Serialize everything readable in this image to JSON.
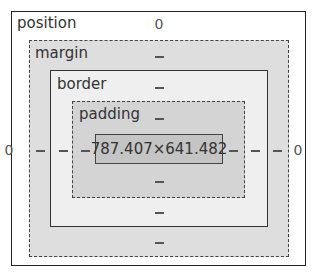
{
  "box_model": {
    "position": {
      "label": "position",
      "top": "0",
      "right": "0",
      "bottom": "",
      "left": "0"
    },
    "margin": {
      "label": "margin",
      "top": "–",
      "right": "–",
      "bottom": "–",
      "left": "–"
    },
    "border": {
      "label": "border",
      "top": "–",
      "right": "–",
      "bottom": "–",
      "left": "–"
    },
    "padding": {
      "label": "padding",
      "top": "–",
      "right": "–",
      "bottom": "–",
      "left": "–"
    },
    "content": {
      "size": "787.407×641.482"
    }
  }
}
